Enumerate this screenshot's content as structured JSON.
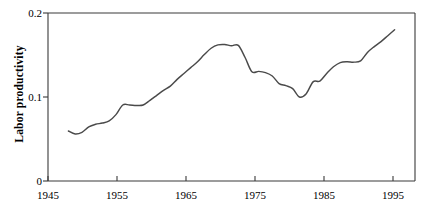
{
  "chart_data": {
    "type": "line",
    "title": "",
    "subtitle": "",
    "xlabel": "",
    "ylabel": "Labor productivity",
    "xlim": [
      1945,
      1999
    ],
    "ylim": [
      0,
      0.2
    ],
    "grid": false,
    "legend": null,
    "x_ticks": [
      1945,
      1955,
      1965,
      1975,
      1985,
      1995
    ],
    "x_tick_labels": [
      "1945",
      "1955",
      "1965",
      "1975",
      "1985",
      "1995"
    ],
    "y_ticks": [
      0,
      0.1,
      0.2
    ],
    "y_tick_labels": [
      "0",
      "0.1",
      "0.2"
    ],
    "series": [
      {
        "name": "Labor productivity",
        "color": "#4a4a4a",
        "x": [
          1948,
          1949,
          1950,
          1951,
          1952,
          1953,
          1954,
          1955,
          1956,
          1957,
          1958,
          1959,
          1960,
          1961,
          1962,
          1963,
          1964,
          1965,
          1966,
          1967,
          1968,
          1969,
          1970,
          1971,
          1972,
          1973,
          1974,
          1975,
          1976,
          1977,
          1978,
          1979,
          1980,
          1981,
          1982,
          1983,
          1984,
          1985,
          1986,
          1987,
          1988,
          1989,
          1990,
          1991,
          1992,
          1993,
          1994,
          1995,
          1996
        ],
        "values": [
          0.0595,
          0.056,
          0.058,
          0.0645,
          0.0675,
          0.069,
          0.0715,
          0.079,
          0.0905,
          0.0905,
          0.09,
          0.0905,
          0.096,
          0.102,
          0.108,
          0.113,
          0.121,
          0.128,
          0.135,
          0.142,
          0.1505,
          0.158,
          0.162,
          0.1625,
          0.161,
          0.1615,
          0.147,
          0.13,
          0.1305,
          0.129,
          0.125,
          0.116,
          0.1135,
          0.11,
          0.1,
          0.104,
          0.118,
          0.119,
          0.128,
          0.136,
          0.141,
          0.142,
          0.1415,
          0.143,
          0.153,
          0.16,
          0.166,
          0.173,
          0.18
        ]
      }
    ]
  },
  "axes": {
    "y_axis_title": "Labor productivity"
  }
}
